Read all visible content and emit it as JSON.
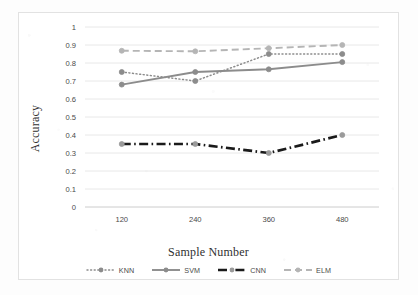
{
  "chart_data": {
    "type": "line",
    "title": "",
    "xlabel": "Sample Number",
    "ylabel": "Accuracy",
    "categories": [
      "120",
      "240",
      "360",
      "480"
    ],
    "ylim": [
      0,
      1
    ],
    "yticks": [
      "0",
      "0.1",
      "0.2",
      "0.3",
      "0.4",
      "0.5",
      "0.6",
      "0.7",
      "0.8",
      "0.9",
      "1"
    ],
    "ytick_values": [
      0,
      0.1,
      0.2,
      0.3,
      0.4,
      0.5,
      0.6,
      0.7,
      0.8,
      0.9,
      1
    ],
    "grid": "horizontal",
    "legend_position": "bottom",
    "series": [
      {
        "name": "KNN",
        "values": [
          0.75,
          0.7,
          0.85,
          0.85
        ],
        "color": "#8c8c8c",
        "style": "dotted",
        "marker": "circle"
      },
      {
        "name": "SVM",
        "values": [
          0.68,
          0.75,
          0.765,
          0.805
        ],
        "color": "#8c8c8c",
        "style": "solid",
        "marker": "circle"
      },
      {
        "name": "CNN",
        "values": [
          0.35,
          0.35,
          0.3,
          0.4
        ],
        "color": "#1a1a1a",
        "style": "dash-dot",
        "marker": "circle"
      },
      {
        "name": "ELM",
        "values": [
          0.868,
          0.865,
          0.882,
          0.9
        ],
        "color": "#b5b5b5",
        "style": "dashed",
        "marker": "circle"
      }
    ]
  }
}
